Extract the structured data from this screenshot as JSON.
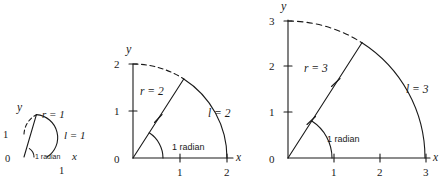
{
  "figure": {
    "background": "#ffffff",
    "stroke_color": "#1a1a1a",
    "panels": [
      {
        "id": "panel-r1",
        "radius_value": 1,
        "radius_label": "r = 1",
        "arc_label": "l = 1",
        "angle_label": "1 radian",
        "axis_x_label": "x",
        "axis_y_label": "y",
        "origin_label": "0",
        "x_ticks": [
          "1"
        ],
        "y_ticks": [
          "1"
        ],
        "radius_tick_count": 0,
        "axes_drawn": false
      },
      {
        "id": "panel-r2",
        "radius_value": 2,
        "radius_label": "r = 2",
        "arc_label": "l = 2",
        "angle_label": "1 radian",
        "axis_x_label": "x",
        "axis_y_label": "y",
        "origin_label": "0",
        "x_ticks": [
          "1",
          "2"
        ],
        "y_ticks": [
          "1",
          "2"
        ],
        "radius_tick_count": 1,
        "axes_drawn": true
      },
      {
        "id": "panel-r3",
        "radius_value": 3,
        "radius_label": "r = 3",
        "arc_label": "l = 3",
        "angle_label": "1 radian",
        "axis_x_label": "x",
        "axis_y_label": "y",
        "origin_label": "0",
        "x_ticks": [
          "1",
          "2",
          "3"
        ],
        "y_ticks": [
          "1",
          "2",
          "3"
        ],
        "radius_tick_count": 2,
        "axes_drawn": true
      }
    ]
  }
}
